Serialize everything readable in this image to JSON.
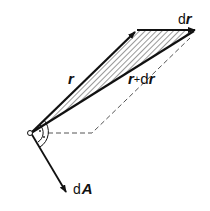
{
  "diagram": {
    "title": "",
    "labels": {
      "r": "r",
      "r_plus_dr_prefix": "r",
      "r_plus_dr_plus": "+",
      "r_plus_dr_d": "d",
      "r_plus_dr_r": "r",
      "dr_d": "d",
      "dr_r": "r",
      "dA_d": "d",
      "dA_A": "A"
    },
    "colors": {
      "stroke": "#111111",
      "hatch": "#333333",
      "dashed": "#555555",
      "background": "#ffffff"
    },
    "elements": [
      {
        "id": "vector-r",
        "from": "origin",
        "to": "tip-r",
        "style": "arrow"
      },
      {
        "id": "vector-dr",
        "from": "tip-r",
        "to": "tip-r-plus-dr",
        "style": "arrow"
      },
      {
        "id": "vector-r-plus-dr",
        "from": "origin",
        "to": "tip-r-plus-dr",
        "style": "arrow"
      },
      {
        "id": "hatched-triangle",
        "vertices": [
          "origin",
          "tip-r",
          "tip-r-plus-dr"
        ]
      },
      {
        "id": "dashed-parallelogram-edges",
        "style": "dashed"
      },
      {
        "id": "vector-dA",
        "from": "origin",
        "style": "arrow",
        "perpendicular_to": "plane"
      },
      {
        "id": "right-angle-marks",
        "count": 2
      }
    ]
  }
}
